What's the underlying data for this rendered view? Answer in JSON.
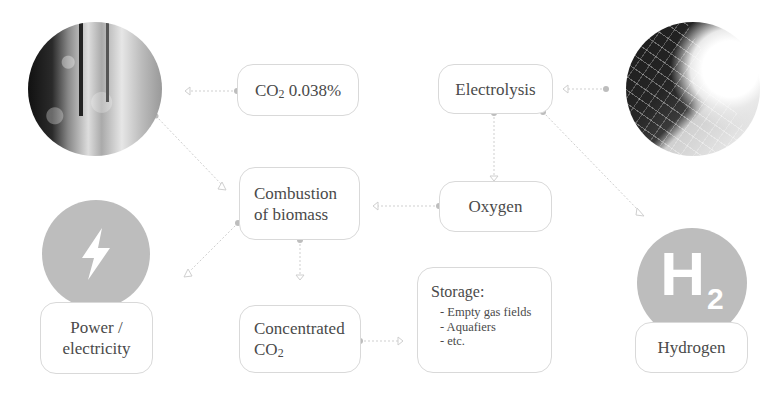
{
  "diagram": {
    "nodes": {
      "co2_air": {
        "label": "CO",
        "sub": "2",
        "suffix": " 0.038%"
      },
      "electrolysis": {
        "label": "Electrolysis"
      },
      "combustion": {
        "line1": "Combustion",
        "line2": "of biomass"
      },
      "oxygen": {
        "label": "Oxygen"
      },
      "power": {
        "line1": "Power /",
        "line2": "electricity"
      },
      "concentrated": {
        "line1": "Concentrated",
        "line2": "CO",
        "sub": "2"
      },
      "storage": {
        "title": "Storage:",
        "items": [
          "- Empty gas fields",
          "- Aquafiers",
          "- etc."
        ]
      },
      "hydrogen": {
        "label": "Hydrogen",
        "icon_main": "H",
        "icon_sub": "2"
      }
    },
    "images": {
      "forest": "forest-photo",
      "solar": "solar-panel-photo"
    },
    "icons": {
      "power": "lightning-bolt-icon",
      "hydrogen": "h2-molecule-icon"
    },
    "colors": {
      "border": "#d9d9d9",
      "connector": "#cfcfcf",
      "dot": "#bdbdbd",
      "icon_circle": "#bdbdbd",
      "text": "#4a4a4a"
    }
  }
}
